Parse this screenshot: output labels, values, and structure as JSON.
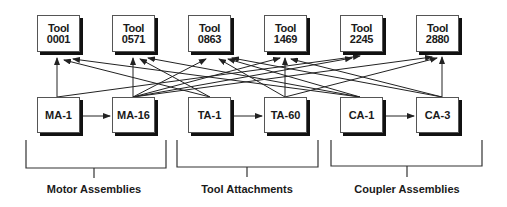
{
  "tools": [
    {
      "line1": "Tool",
      "line2": "0001"
    },
    {
      "line1": "Tool",
      "line2": "0571"
    },
    {
      "line1": "Tool",
      "line2": "0863"
    },
    {
      "line1": "Tool",
      "line2": "1469"
    },
    {
      "line1": "Tool",
      "line2": "2245"
    },
    {
      "line1": "Tool",
      "line2": "2880"
    }
  ],
  "assemblies": [
    {
      "label": "MA-1"
    },
    {
      "label": "MA-16"
    },
    {
      "label": "TA-1"
    },
    {
      "label": "TA-60"
    },
    {
      "label": "CA-1"
    },
    {
      "label": "CA-3"
    }
  ],
  "groups": [
    {
      "label": "Motor Assemblies"
    },
    {
      "label": "Tool Attachments"
    },
    {
      "label": "Coupler Assemblies"
    }
  ],
  "colors": {
    "line": "#222222",
    "shadow": "#111111",
    "border": "#555555"
  }
}
